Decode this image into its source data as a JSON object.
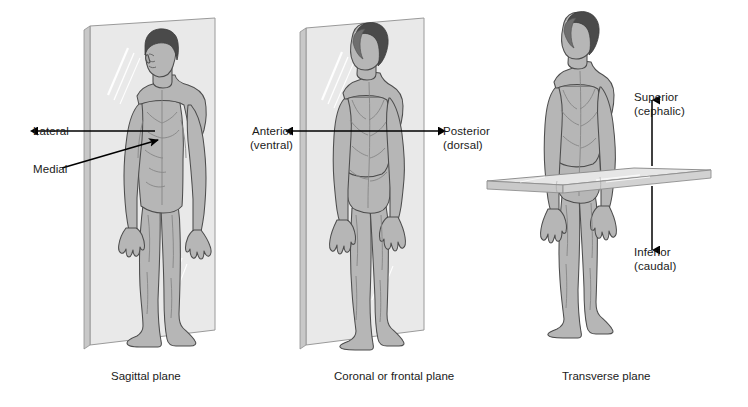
{
  "diagram": {
    "background_color": "#ffffff",
    "text_color": "#1a1a1a",
    "plane_fill": "#e9e9e9",
    "plane_edge": "#9a9a9a",
    "body_fill": "#b4b4b4",
    "body_outline": "#4d4d4d",
    "hair_color": "#4a4a4a",
    "arrow_color": "#000000"
  },
  "panels": [
    {
      "id": "sagittal",
      "caption": "Sagittal plane",
      "labels": [
        {
          "id": "lateral",
          "line1": "Lateral",
          "line2": ""
        },
        {
          "id": "medial",
          "line1": "Medial",
          "line2": ""
        }
      ]
    },
    {
      "id": "coronal",
      "caption": "Coronal or frontal plane",
      "labels": [
        {
          "id": "anterior",
          "line1": "Anterior",
          "line2": "(ventral)"
        },
        {
          "id": "posterior",
          "line1": "Posterior",
          "line2": "(dorsal)"
        }
      ]
    },
    {
      "id": "transverse",
      "caption": "Transverse plane",
      "labels": [
        {
          "id": "superior",
          "line1": "Superior",
          "line2": "(cephalic)"
        },
        {
          "id": "inferior",
          "line1": "Inferior",
          "line2": "(caudal)"
        }
      ]
    }
  ],
  "captions": {
    "sagittal": "Sagittal plane",
    "coronal": "Coronal or frontal plane",
    "transverse": "Transverse plane"
  },
  "labels": {
    "lateral_1": "Lateral",
    "medial_1": "Medial",
    "anterior_1": "Anterior",
    "anterior_2": "(ventral)",
    "posterior_1": "Posterior",
    "posterior_2": "(dorsal)",
    "superior_1": "Superior",
    "superior_2": "(cephalic)",
    "inferior_1": "Inferior",
    "inferior_2": "(caudal)"
  }
}
